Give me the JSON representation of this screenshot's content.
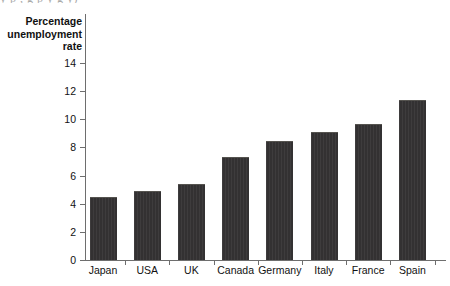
{
  "figure": {
    "bleed_text_above": "y p , g p y g y)",
    "axis_title_lines": [
      "Percentage",
      "unemployment",
      "rate"
    ]
  },
  "chart_data": {
    "type": "bar",
    "title": "",
    "xlabel": "",
    "ylabel": "Percentage unemployment rate",
    "categories": [
      "Japan",
      "USA",
      "UK",
      "Canada",
      "Germany",
      "Italy",
      "France",
      "Spain"
    ],
    "values": [
      4.5,
      4.9,
      5.4,
      7.3,
      8.45,
      9.1,
      9.65,
      11.4
    ],
    "ylim": [
      0,
      15
    ],
    "yticks": [
      0,
      2,
      4,
      6,
      8,
      10,
      12,
      14
    ],
    "ytick_labels": [
      "0",
      "2",
      "4",
      "6",
      "8",
      "10",
      "12",
      "14"
    ],
    "grid": false,
    "legend": false,
    "bar_color": "#333132",
    "axis_color": "#6e6e6e"
  }
}
